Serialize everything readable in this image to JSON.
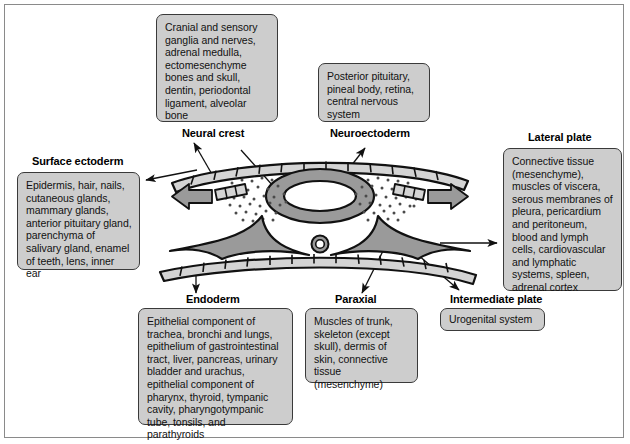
{
  "figure": {
    "frame_color": "#8a8a8a",
    "box_fill": "#cdcdcd",
    "box_border": "#3a3a3a",
    "mesoderm_fill": "#9a9a9a",
    "epithelium_fill": "#d4d4d4"
  },
  "labels": {
    "neural_crest": "Neural crest",
    "neuroectoderm": "Neuroectoderm",
    "lateral_plate": "Lateral plate",
    "surface_ectoderm": "Surface ectoderm",
    "endoderm": "Endoderm",
    "paraxial": "Paraxial",
    "intermediate_plate": "Intermediate plate"
  },
  "boxes": {
    "neural_crest": "Cranial and sensory ganglia and nerves, adrenal medulla, ectomesenchyme bones and skull, dentin, periodontal ligament, alveolar bone",
    "neuroectoderm": "Posterior pituitary, pineal body, retina, central nervous system",
    "lateral_plate": "Connective tissue (mesenchyme), muscles of viscera, serous membranes of pleura, pericardium and peritoneum, blood and lymph cells, cardiovascular and lymphatic systems, spleen, adrenal cortex",
    "surface_ectoderm": "Epidermis, hair, nails, cutaneous glands, mammary glands, anterior pituitary gland, parenchyma of salivary gland, enamel of teeth, lens, inner ear",
    "endoderm": "Epithelial component of trachea, bronchi and lungs, epithelium of gastrointestinal tract, liver, pancreas, urinary bladder and urachus, epithelial component of pharynx, thyroid, tympanic cavity, pharyngotympanic tube, tonsils, and parathyroids",
    "paraxial": "Muscles of trunk, skeleton (except skull), dermis of skin, connective tissue (mesenchyme)",
    "intermediate_plate": "Urogenital system"
  },
  "diagram": {
    "structures": [
      "surface-ectoderm-epithelium",
      "neural-tube",
      "notochord",
      "neural-crest-cells-left",
      "neural-crest-cells-right",
      "mesoderm-wing-left",
      "mesoderm-wing-right",
      "endoderm-epithelium",
      "migration-arrow-left",
      "migration-arrow-right"
    ]
  }
}
